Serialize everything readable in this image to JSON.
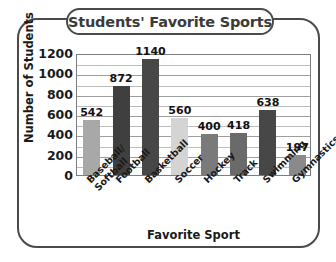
{
  "chart_data": {
    "type": "bar",
    "title": "Students' Favorite Sports",
    "xlabel": "Favorite Sport",
    "ylabel": "Number of Students",
    "categories": [
      "Baseball/ Softball",
      "Football",
      "Basketball",
      "Soccer",
      "Hockey",
      "Track",
      "Swimming",
      "Gymnastics"
    ],
    "category_lines": [
      [
        "Baseball/",
        "Softball"
      ],
      [
        "Football"
      ],
      [
        "Basketball"
      ],
      [
        "Soccer"
      ],
      [
        "Hockey"
      ],
      [
        "Track"
      ],
      [
        "Swimming"
      ],
      [
        "Gymnastics"
      ]
    ],
    "values": [
      542,
      872,
      1140,
      560,
      400,
      418,
      638,
      197
    ],
    "bar_colors": [
      "#a8a8a8",
      "#3f3f3f",
      "#474747",
      "#d4d4d4",
      "#7a7a7a",
      "#6a6a6a",
      "#474747",
      "#8a8a8a"
    ],
    "ylim": [
      0,
      1200
    ],
    "ytick_labels": [
      "1200",
      "1000",
      "800",
      "600",
      "400",
      "200",
      "0"
    ],
    "ytick_values": [
      1200,
      1000,
      800,
      600,
      400,
      200,
      0
    ],
    "major_gridline_step": 200,
    "minor_gridline_step": 100,
    "grid": true,
    "legend": "none"
  },
  "style": {
    "frame_color": "#4a4a4a",
    "title_color": "#3b3b3b",
    "axis_text_color": "#1a1a1a",
    "gridline_color": "#9e9e9e",
    "plot_border_color": "#7d7d7d"
  }
}
